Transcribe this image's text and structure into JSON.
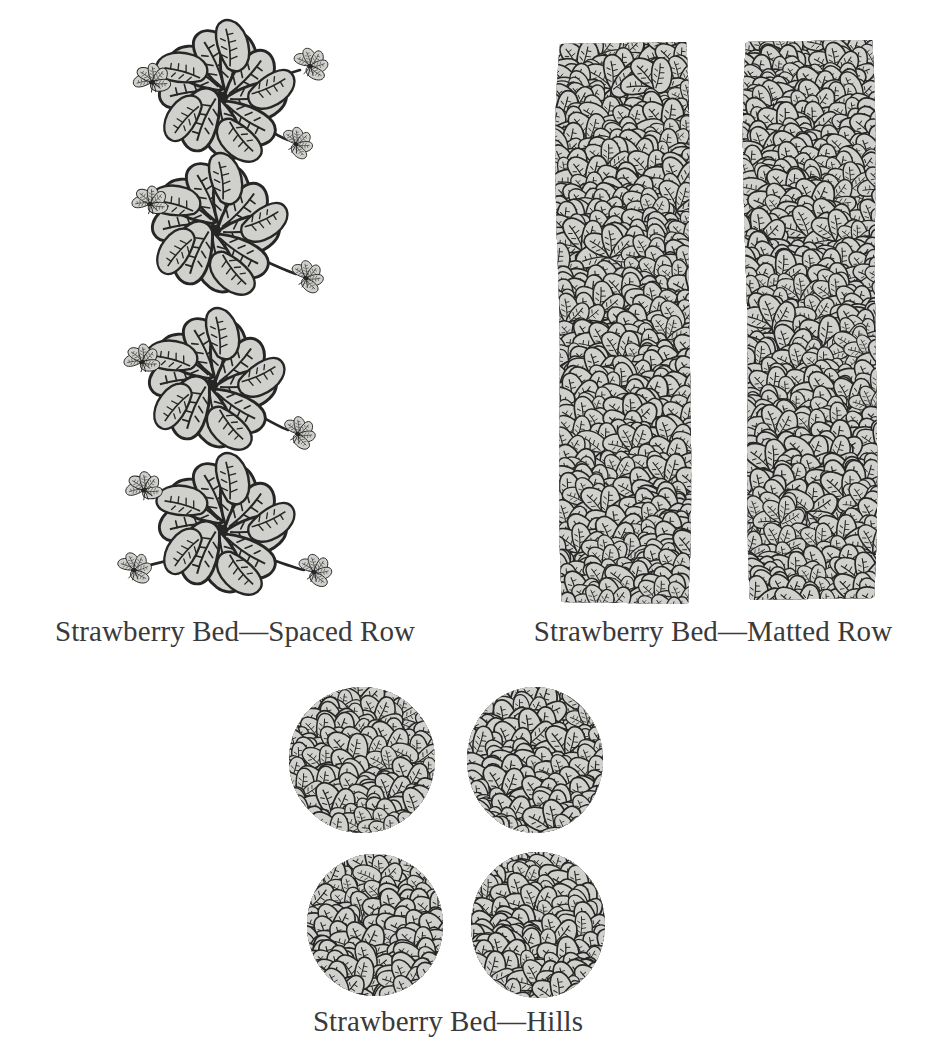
{
  "figure": {
    "medium": "black-and-white line engraving / stipple illustration",
    "background_color": "#ffffff",
    "ink_color": "#2a2a2a",
    "leaf_fill_color": "#d0d0cc",
    "leaf_shadow_color": "#262626",
    "caption_color": "#3a3a3a"
  },
  "captions": {
    "spaced_row": "Strawberry Bed—Spaced Row",
    "matted_row": "Strawberry Bed—Matted Row",
    "hills": "Strawberry Bed—Hills"
  },
  "panels": [
    {
      "id": "spaced-row",
      "label": "Strawberry Bed—Spaced Row",
      "description": "Four individual strawberry mother plants arranged in a vertical column, each a rosette of serrated trifoliate leaves with thin runners (stolons) extending outward to small daughter plantlets.",
      "plant_count": 4,
      "plants": [
        {
          "cx": 222,
          "cy": 95,
          "runners": [
            "left",
            "right",
            "lower-right"
          ]
        },
        {
          "cx": 215,
          "cy": 228,
          "runners": [
            "upper-left",
            "lower-right"
          ]
        },
        {
          "cx": 212,
          "cy": 383,
          "runners": [
            "upper-left",
            "lower-right"
          ]
        },
        {
          "cx": 222,
          "cy": 528,
          "runners": [
            "upper-left",
            "lower-left",
            "lower-right"
          ]
        }
      ]
    },
    {
      "id": "matted-row",
      "label": "Strawberry Bed—Matted Row",
      "description": "Two continuous dense vertical bands of overlapping strawberry foliage, plants grown together into solid matted rows.",
      "band_count": 2,
      "bands": [
        {
          "x": 558,
          "y": 38,
          "width": 132,
          "height": 570
        },
        {
          "x": 744,
          "y": 36,
          "width": 132,
          "height": 566
        }
      ]
    },
    {
      "id": "hills",
      "label": "Strawberry Bed—Hills",
      "description": "Four separate rounded clumps of strawberry plants in a two-by-two arrangement, runners removed so each hill stays distinct.",
      "clump_count": 4,
      "clumps": [
        {
          "cx": 362,
          "cy": 760,
          "rx": 72,
          "ry": 72
        },
        {
          "cx": 535,
          "cy": 760,
          "rx": 68,
          "ry": 72
        },
        {
          "cx": 375,
          "cy": 925,
          "rx": 68,
          "ry": 70
        },
        {
          "cx": 538,
          "cy": 925,
          "rx": 66,
          "ry": 72
        }
      ]
    }
  ]
}
